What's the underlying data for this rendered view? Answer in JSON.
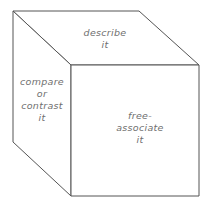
{
  "diagram": {
    "faces": {
      "top": {
        "text": "describe\nit"
      },
      "left": {
        "text": "compare\nor\ncontrast\nit"
      },
      "front": {
        "text": "free-\nassociate\nit"
      }
    },
    "colors": {
      "stroke": "#555555",
      "text": "#6f6f6f",
      "background": "#ffffff"
    }
  }
}
